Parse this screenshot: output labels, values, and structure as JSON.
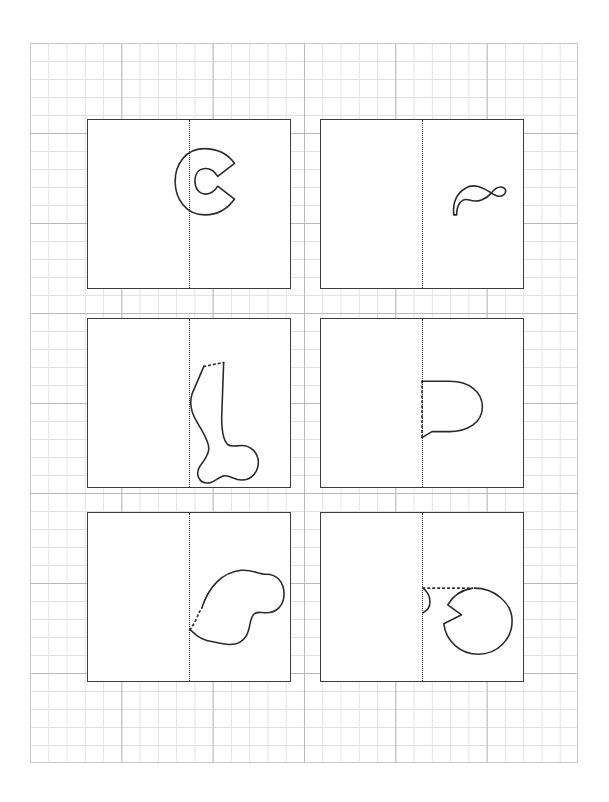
{
  "page": {
    "background_color": "#ffffff",
    "width": 609,
    "height": 802
  },
  "grid": {
    "name": "graph-paper",
    "x": 30,
    "y": 43,
    "width": 548,
    "height": 720,
    "minor_cell_px": 18,
    "major_cell_px": 90,
    "minor_line_color": "#e2e2e2",
    "major_line_color": "#b9b9b9"
  },
  "panels": [
    {
      "id": "panel-1",
      "label": "C shape",
      "x": 87,
      "y": 119,
      "width": 204,
      "height": 170,
      "border_color": "#3c3c3c",
      "fold_line": "vertical-center-dotted",
      "shape_name": "c-letter-shape",
      "shape_solid_path": "M 117 29 C 98 29 88 46 88 62 C 88 80 99 96 118 96 C 131 96 141 90 148 80 L 131 67 C 128 72 124 75 119 75 C 112 75 108 69 108 62 C 108 54 112 49 119 49 C 124 49 128 52 131 57 L 148 44 C 141 34 131 29 117 29 Z",
      "shape_dotted_path": "",
      "shape_solid_path_2": ""
    },
    {
      "id": "panel-2",
      "label": "wavy ribbon shape",
      "x": 320,
      "y": 119,
      "width": 204,
      "height": 170,
      "border_color": "#3c3c3c",
      "fold_line": "vertical-center-dotted",
      "shape_name": "wavy-ribbon-shape",
      "shape_solid_path": "M 134 96 C 133 84 137 74 146 69 C 154 64 162 68 169 72 C 175 76 180 79 184 76 C 188 73 187 69 183 68 C 179 67 175 70 172 74 C 167 80 158 84 150 81 C 141 78 137 87 137 96 Z",
      "shape_dotted_path": "",
      "shape_solid_path_2": ""
    },
    {
      "id": "panel-3",
      "label": "leg / boot shape",
      "x": 87,
      "y": 318,
      "width": 204,
      "height": 170,
      "border_color": "#3c3c3c",
      "fold_line": "vertical-center-dotted",
      "shape_name": "leg-boot-shape",
      "shape_solid_path": "M 117 48 L 105 76 C 102 86 105 96 110 104 C 116 115 122 123 122 131 C 122 138 117 143 113 149 C 108 157 112 166 121 166 C 127 166 130 161 136 159 C 143 157 147 163 155 163 C 166 163 172 154 172 145 C 172 135 164 128 155 128 C 149 128 145 130 141 127 C 136 122 135 111 135 100 L 137 44",
      "shape_dotted_path": "M 117 48 L 137 44",
      "shape_solid_path_2": ""
    },
    {
      "id": "panel-4",
      "label": "D shape",
      "x": 320,
      "y": 318,
      "width": 204,
      "height": 170,
      "border_color": "#3c3c3c",
      "fold_line": "vertical-center-dotted",
      "shape_name": "d-letter-shape",
      "shape_solid_path": "M 102 63 L 130 63 C 150 63 163 74 163 89 C 163 104 149 114 129 114 L 112 114 L 102 120",
      "shape_dotted_path": "M 102 63 L 102 120",
      "shape_solid_path_2": ""
    },
    {
      "id": "panel-5",
      "label": "mitten blob shape",
      "x": 87,
      "y": 512,
      "width": 204,
      "height": 170,
      "border_color": "#3c3c3c",
      "fold_line": "vertical-center-dotted",
      "shape_name": "mitten-blob-shape",
      "shape_solid_path": "M 115 96 C 122 74 136 60 155 58 C 166 57 172 62 180 62 C 191 62 198 70 198 82 C 198 94 190 101 180 101 C 174 101 170 99 167 103 C 163 108 164 117 160 124 C 156 131 149 133 143 133 C 136 133 131 131 125 130 C 119 129 114 127 110 124 L 103 118",
      "shape_dotted_path": "M 103 118 C 107 113 110 106 112 101 L 115 96",
      "shape_solid_path_2": ""
    },
    {
      "id": "panel-6",
      "label": "pac-man circle shape",
      "x": 320,
      "y": 512,
      "width": 204,
      "height": 170,
      "border_color": "#3c3c3c",
      "fold_line": "vertical-center-dotted",
      "shape_name": "pacman-circle-shape",
      "shape_solid_path": "M 153 76 C 142 78 133 84 128 93 L 142 103 L 124 112 C 126 130 141 143 159 143 C 178 143 193 128 193 109 C 193 91 175 76 155 76",
      "shape_dotted_path": "M 103 76 L 153 76",
      "shape_solid_path_2": "M 103 76 C 107 79 110 84 110 90 C 110 95 107 99 103 101"
    }
  ]
}
